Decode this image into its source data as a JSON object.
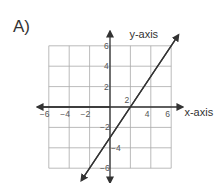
{
  "label": "A)",
  "chart_data": {
    "type": "line",
    "title": "",
    "xlabel": "x-axis",
    "ylabel": "y-axis",
    "xlim": [
      -6,
      6
    ],
    "ylim": [
      -6,
      6
    ],
    "grid": true,
    "grid_step": 2,
    "x_ticks": [
      "−6",
      "−4",
      "−2",
      "2",
      "4",
      "6"
    ],
    "y_ticks": [
      "6",
      "4",
      "2",
      "−2",
      "−4",
      "−6"
    ],
    "series": [
      {
        "name": "line",
        "equation": "y = 1.5x - 3",
        "x": [
          -2.8,
          0,
          2,
          6.7
        ],
        "y": [
          -7.2,
          -3,
          0,
          7.05
        ]
      }
    ],
    "x_intercept": 2,
    "y_intercept": -3
  }
}
